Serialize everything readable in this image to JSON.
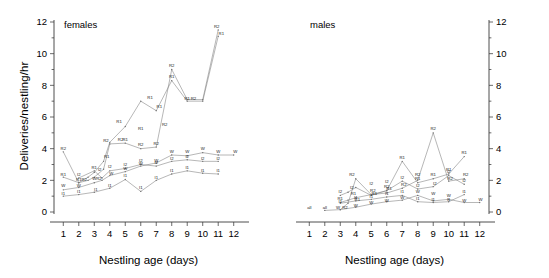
{
  "figure": {
    "ylabel": "Deliveries/nestling/hr",
    "panels": [
      {
        "key": "females",
        "title": "females",
        "xlabel": "Nestling age (days)"
      },
      {
        "key": "males",
        "title": "males",
        "xlabel": "Nestling age (days)"
      }
    ]
  },
  "axes": {
    "y_ticks": [
      "0",
      "2",
      "4",
      "6",
      "8",
      "10",
      "12"
    ],
    "y_tick_values": [
      0,
      2,
      4,
      6,
      8,
      10,
      12
    ],
    "y_minor_values": [
      1,
      3,
      5,
      7,
      9,
      11
    ],
    "x_ticks": [
      "1",
      "2",
      "3",
      "4",
      "5",
      "6",
      "7",
      "8",
      "9",
      "10",
      "11",
      "12"
    ],
    "x_tick_values": [
      1,
      2,
      3,
      4,
      5,
      6,
      7,
      8,
      9,
      10,
      11,
      12
    ],
    "ylim": [
      0,
      12
    ],
    "xlim": [
      0.4,
      12.6
    ]
  },
  "chart_data": {
    "type": "line",
    "title": "",
    "xlabel": "Nestling age (days)",
    "ylabel": "Deliveries/nestling/hr",
    "ylim": [
      0,
      12
    ],
    "xlim": [
      0.4,
      12.6
    ],
    "grid": false,
    "legend": "point-labels",
    "panels": [
      {
        "name": "females",
        "series": [
          {
            "name": "R1",
            "label": "R1",
            "x": [
              1,
              2,
              2.6,
              3,
              3.6,
              4,
              5,
              6,
              7,
              8,
              9,
              10,
              11
            ],
            "y": [
              2.2,
              1.85,
              2.2,
              2.5,
              3.2,
              4.4,
              5.4,
              7.0,
              6.4,
              8.3,
              7.0,
              7.0,
              11.1
            ]
          },
          {
            "name": "R2",
            "label": "R2",
            "x": [
              1,
              2,
              2.6,
              3,
              3.6,
              4,
              5,
              6,
              7,
              8,
              9,
              10,
              11
            ],
            "y": [
              3.8,
              1.85,
              2.0,
              2.2,
              2.7,
              4.3,
              4.35,
              4.0,
              4.1,
              9.0,
              7.1,
              7.1,
              11.5
            ]
          },
          {
            "name": "W",
            "label": "W",
            "x": [
              1,
              2,
              3,
              3.5,
              4,
              5,
              6,
              7,
              8,
              9,
              10,
              11,
              12
            ],
            "y": [
              1.4,
              1.55,
              1.85,
              2.0,
              2.3,
              2.55,
              2.9,
              3.1,
              3.6,
              3.55,
              3.75,
              3.6,
              3.6
            ]
          },
          {
            "name": "I1",
            "label": "I1",
            "x": [
              1,
              2,
              3,
              4,
              5,
              6,
              7,
              8,
              9,
              10,
              11
            ],
            "y": [
              1.0,
              1.1,
              1.25,
              1.5,
              2.05,
              1.3,
              2.0,
              2.4,
              2.6,
              2.45,
              2.4
            ]
          },
          {
            "name": "I2",
            "label": "I2",
            "x": [
              2,
              3,
              3.5,
              4,
              5,
              6,
              7,
              8,
              9,
              10,
              11
            ],
            "y": [
              2.15,
              2.6,
              2.15,
              2.6,
              2.75,
              3.0,
              2.9,
              3.2,
              3.3,
              3.2,
              3.2
            ]
          }
        ],
        "point_labels": [
          {
            "text": "R2",
            "x": 1.0,
            "y": 3.8
          },
          {
            "text": "R1",
            "x": 1.0,
            "y": 2.2
          },
          {
            "text": "W",
            "x": 1.0,
            "y": 1.45
          },
          {
            "text": "I1",
            "x": 1.0,
            "y": 1.0
          },
          {
            "text": "I2",
            "x": 2.0,
            "y": 2.2
          },
          {
            "text": "R1",
            "x": 2.0,
            "y": 1.85
          },
          {
            "text": "R2",
            "x": 2.35,
            "y": 1.85
          },
          {
            "text": "W",
            "x": 2.0,
            "y": 1.5
          },
          {
            "text": "I1",
            "x": 2.0,
            "y": 1.1
          },
          {
            "text": "R1",
            "x": 3.0,
            "y": 2.6
          },
          {
            "text": "I2",
            "x": 3.35,
            "y": 2.5
          },
          {
            "text": "W",
            "x": 3.0,
            "y": 1.95
          },
          {
            "text": "R2",
            "x": 3.3,
            "y": 1.95
          },
          {
            "text": "I1",
            "x": 3.1,
            "y": 1.2
          },
          {
            "text": "R2",
            "x": 3.75,
            "y": 4.35
          },
          {
            "text": "R1",
            "x": 3.8,
            "y": 3.3
          },
          {
            "text": "I2",
            "x": 4.0,
            "y": 2.7
          },
          {
            "text": "W",
            "x": 4.1,
            "y": 2.25
          },
          {
            "text": "I1",
            "x": 4.0,
            "y": 1.5
          },
          {
            "text": "R1",
            "x": 4.6,
            "y": 5.5
          },
          {
            "text": "R2",
            "x": 4.7,
            "y": 4.4
          },
          {
            "text": "R1",
            "x": 5.0,
            "y": 4.4
          },
          {
            "text": "I2",
            "x": 5.0,
            "y": 2.8
          },
          {
            "text": "W",
            "x": 5.0,
            "y": 2.55
          },
          {
            "text": "I1",
            "x": 5.0,
            "y": 2.1
          },
          {
            "text": "R1",
            "x": 6.0,
            "y": 5.1
          },
          {
            "text": "R2",
            "x": 6.0,
            "y": 4.05
          },
          {
            "text": "W",
            "x": 6.0,
            "y": 2.85
          },
          {
            "text": "I2",
            "x": 6.0,
            "y": 3.05
          },
          {
            "text": "I1",
            "x": 6.0,
            "y": 1.35
          },
          {
            "text": "R1",
            "x": 6.6,
            "y": 7.05
          },
          {
            "text": "R1",
            "x": 7.2,
            "y": 6.45
          },
          {
            "text": "R2",
            "x": 7.0,
            "y": 4.1
          },
          {
            "text": "W",
            "x": 7.0,
            "y": 3.05
          },
          {
            "text": "I2",
            "x": 7.0,
            "y": 2.9
          },
          {
            "text": "I1",
            "x": 7.0,
            "y": 2.0
          },
          {
            "text": "R2",
            "x": 7.55,
            "y": 5.35
          },
          {
            "text": "R2",
            "x": 8.0,
            "y": 9.05
          },
          {
            "text": "R1",
            "x": 8.0,
            "y": 8.35
          },
          {
            "text": "W",
            "x": 8.0,
            "y": 3.65
          },
          {
            "text": "I2",
            "x": 8.0,
            "y": 3.2
          },
          {
            "text": "I1",
            "x": 8.0,
            "y": 2.45
          },
          {
            "text": "R1",
            "x": 9.0,
            "y": 7.0
          },
          {
            "text": "R2",
            "x": 9.4,
            "y": 7.0
          },
          {
            "text": "W",
            "x": 9.0,
            "y": 3.6
          },
          {
            "text": "I2",
            "x": 9.0,
            "y": 3.3
          },
          {
            "text": "I1",
            "x": 9.0,
            "y": 2.6
          },
          {
            "text": "W",
            "x": 10.0,
            "y": 3.8
          },
          {
            "text": "I2",
            "x": 10.0,
            "y": 3.2
          },
          {
            "text": "I1",
            "x": 10.0,
            "y": 2.45
          },
          {
            "text": "R2",
            "x": 10.9,
            "y": 11.55
          },
          {
            "text": "R1",
            "x": 11.2,
            "y": 11.1
          },
          {
            "text": "W",
            "x": 11.0,
            "y": 3.65
          },
          {
            "text": "I2",
            "x": 11.0,
            "y": 3.2
          },
          {
            "text": "I1",
            "x": 11.0,
            "y": 2.4
          },
          {
            "text": "W",
            "x": 12.1,
            "y": 3.6
          }
        ]
      },
      {
        "name": "males",
        "series": [
          {
            "name": "R1",
            "label": "R1",
            "x": [
              3,
              3.5,
              4,
              5,
              6,
              7,
              8,
              9,
              10,
              11
            ],
            "y": [
              0.6,
              0.75,
              0.9,
              1.1,
              1.35,
              3.2,
              1.85,
              2.1,
              2.4,
              3.5
            ]
          },
          {
            "name": "R2",
            "label": "R2",
            "x": [
              3,
              3.5,
              4,
              5,
              6,
              7,
              8,
              9,
              10,
              11
            ],
            "y": [
              0.15,
              0.55,
              2.1,
              1.1,
              1.2,
              1.5,
              2.0,
              5.0,
              1.95,
              2.1
            ]
          },
          {
            "name": "W",
            "label": "W",
            "x": [
              2,
              3,
              4,
              5,
              6,
              7,
              8,
              9,
              10,
              11,
              12
            ],
            "y": [
              0.1,
              0.15,
              0.3,
              0.5,
              0.65,
              0.75,
              1.05,
              0.7,
              0.8,
              0.6,
              0.6
            ]
          },
          {
            "name": "I1",
            "label": "I1",
            "x": [
              3,
              4,
              5,
              6,
              7,
              8,
              9,
              10,
              11
            ],
            "y": [
              0.55,
              0.7,
              0.8,
              0.95,
              1.05,
              0.65,
              0.6,
              0.65,
              1.1
            ]
          },
          {
            "name": "I2",
            "label": "I2",
            "x": [
              3,
              3.5,
              4,
              5,
              6,
              7,
              8,
              9,
              10,
              11
            ],
            "y": [
              1.05,
              1.25,
              1.55,
              1.05,
              1.35,
              1.95,
              1.45,
              1.6,
              2.3,
              1.75
            ]
          }
        ],
        "point_labels": [
          {
            "text": "all",
            "x": 1.0,
            "y": 0.08
          },
          {
            "text": "all",
            "x": 2.0,
            "y": 0.12
          },
          {
            "text": "I2",
            "x": 3.0,
            "y": 1.1
          },
          {
            "text": "R1",
            "x": 3.0,
            "y": 0.65
          },
          {
            "text": "I1",
            "x": 3.0,
            "y": 0.45
          },
          {
            "text": "W",
            "x": 2.85,
            "y": 0.1
          },
          {
            "text": "R2",
            "x": 3.3,
            "y": 0.12
          },
          {
            "text": "R2",
            "x": 3.75,
            "y": 2.15
          },
          {
            "text": "I2",
            "x": 3.75,
            "y": 1.35
          },
          {
            "text": "R1",
            "x": 3.85,
            "y": 0.95
          },
          {
            "text": "I1",
            "x": 4.0,
            "y": 0.75
          },
          {
            "text": "R1",
            "x": 4.1,
            "y": 0.6
          },
          {
            "text": "W",
            "x": 4.0,
            "y": 0.2
          },
          {
            "text": "I2",
            "x": 5.0,
            "y": 1.6
          },
          {
            "text": "R2",
            "x": 5.1,
            "y": 1.15
          },
          {
            "text": "R1",
            "x": 5.2,
            "y": 1.0
          },
          {
            "text": "I1",
            "x": 5.0,
            "y": 0.8
          },
          {
            "text": "W",
            "x": 5.0,
            "y": 0.4
          },
          {
            "text": "I2",
            "x": 6.0,
            "y": 1.75
          },
          {
            "text": "R2",
            "x": 6.0,
            "y": 1.4
          },
          {
            "text": "R1",
            "x": 6.15,
            "y": 1.3
          },
          {
            "text": "I1",
            "x": 6.0,
            "y": 0.95
          },
          {
            "text": "W",
            "x": 6.0,
            "y": 0.55
          },
          {
            "text": "R1",
            "x": 7.0,
            "y": 3.25
          },
          {
            "text": "I2",
            "x": 7.0,
            "y": 2.0
          },
          {
            "text": "R2",
            "x": 7.1,
            "y": 1.55
          },
          {
            "text": "I1",
            "x": 7.0,
            "y": 1.1
          },
          {
            "text": "W",
            "x": 7.0,
            "y": 0.7
          },
          {
            "text": "R2",
            "x": 8.0,
            "y": 2.15
          },
          {
            "text": "R1",
            "x": 8.0,
            "y": 1.9
          },
          {
            "text": "I2",
            "x": 8.0,
            "y": 1.5
          },
          {
            "text": "W",
            "x": 8.0,
            "y": 1.1
          },
          {
            "text": "I1",
            "x": 8.0,
            "y": 0.65
          },
          {
            "text": "R2",
            "x": 9.0,
            "y": 5.1
          },
          {
            "text": "R1",
            "x": 9.0,
            "y": 2.15
          },
          {
            "text": "I2",
            "x": 9.1,
            "y": 1.6
          },
          {
            "text": "W",
            "x": 9.0,
            "y": 0.95
          },
          {
            "text": "I1",
            "x": 9.0,
            "y": 0.6
          },
          {
            "text": "R1",
            "x": 10.0,
            "y": 2.5
          },
          {
            "text": "I2",
            "x": 10.0,
            "y": 2.35
          },
          {
            "text": "R2",
            "x": 10.1,
            "y": 1.95
          },
          {
            "text": "W",
            "x": 10.0,
            "y": 0.85
          },
          {
            "text": "I1",
            "x": 10.0,
            "y": 0.6
          },
          {
            "text": "R1",
            "x": 11.0,
            "y": 3.55
          },
          {
            "text": "R2",
            "x": 11.1,
            "y": 2.15
          },
          {
            "text": "I2",
            "x": 11.0,
            "y": 1.8
          },
          {
            "text": "I1",
            "x": 11.0,
            "y": 1.1
          },
          {
            "text": "W",
            "x": 11.0,
            "y": 0.55
          },
          {
            "text": "W",
            "x": 12.05,
            "y": 0.6
          }
        ]
      }
    ]
  }
}
